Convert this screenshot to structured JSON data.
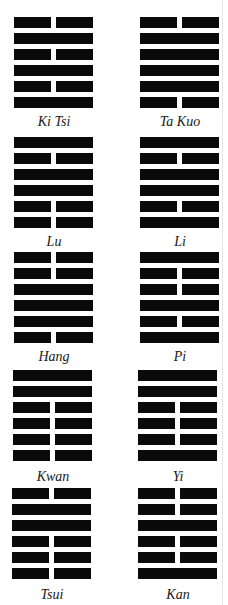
{
  "hexagrams": [
    {
      "name": "Ki Tsi",
      "lines": [
        0,
        1,
        0,
        1,
        0,
        1
      ]
    },
    {
      "name": "Ta Kuo",
      "lines": [
        0,
        1,
        1,
        1,
        1,
        0
      ]
    },
    {
      "name": "Lu",
      "lines": [
        1,
        0,
        1,
        1,
        0,
        0
      ]
    },
    {
      "name": "Li",
      "lines": [
        1,
        0,
        1,
        1,
        0,
        1
      ]
    },
    {
      "name": "Hang",
      "lines": [
        0,
        0,
        1,
        1,
        1,
        0
      ]
    },
    {
      "name": "Pi",
      "lines": [
        1,
        0,
        0,
        1,
        0,
        1
      ]
    },
    {
      "name": "Kwan",
      "lines": [
        1,
        1,
        0,
        0,
        0,
        0
      ]
    },
    {
      "name": "Yi",
      "lines": [
        1,
        1,
        0,
        0,
        0,
        1
      ]
    },
    {
      "name": "Tsui",
      "lines": [
        0,
        1,
        1,
        0,
        0,
        0
      ]
    },
    {
      "name": "Kan",
      "lines": [
        0,
        0,
        1,
        0,
        0,
        1
      ]
    }
  ],
  "line_legend": {
    "1": "solid (yang)",
    "0": "broken (yin)"
  },
  "colors": {
    "ink": "#0a0a0a",
    "background": "#ffffff",
    "label": "#1a1a1a"
  }
}
